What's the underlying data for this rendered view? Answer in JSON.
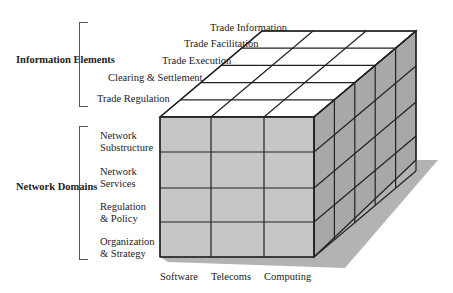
{
  "groups": {
    "information_elements": "Information Elements",
    "network_domains": "Network Domains"
  },
  "information_elements": [
    "Trade Information",
    "Trade Facilitation",
    "Trade Execution",
    "Clearing & Settlement",
    "Trade Regulation"
  ],
  "network_domains": [
    {
      "line1": "Network",
      "line2": "Substructure"
    },
    {
      "line1": "Network",
      "line2": "Services"
    },
    {
      "line1": "Regulation",
      "line2": "& Policy"
    },
    {
      "line1": "Organization",
      "line2": "& Strategy"
    }
  ],
  "columns": [
    "Software",
    "Telecoms",
    "Computing"
  ],
  "colors": {
    "top_face": "#ffffff",
    "front_face": "#c4c4c4",
    "side_face": "#a6a6a6",
    "shadow": "#b0b0b0",
    "line": "#222222"
  }
}
